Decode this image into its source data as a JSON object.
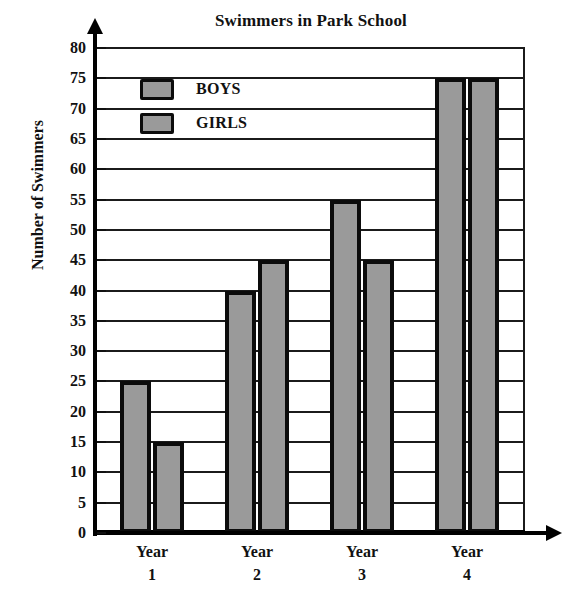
{
  "chart_data": {
    "type": "bar",
    "title": "Swimmers in Park School",
    "xlabel": "",
    "ylabel": "Number of Swimmers",
    "categories": [
      "Year 1",
      "Year 2",
      "Year 3",
      "Year 4"
    ],
    "category_lines": [
      {
        "line1": "Year",
        "line2": "1"
      },
      {
        "line1": "Year",
        "line2": "2"
      },
      {
        "line1": "Year",
        "line2": "3"
      },
      {
        "line1": "Year",
        "line2": "4"
      }
    ],
    "series": [
      {
        "name": "BOYS",
        "values": [
          25,
          40,
          55,
          75
        ],
        "color": "#9a9a9a"
      },
      {
        "name": "GIRLS",
        "values": [
          15,
          45,
          45,
          75
        ],
        "color": "#9a9a9a"
      }
    ],
    "ylim": [
      0,
      80
    ],
    "y_tick_step": 5,
    "y_ticks": [
      80,
      75,
      70,
      65,
      60,
      55,
      50,
      45,
      40,
      35,
      30,
      25,
      20,
      15,
      10,
      5,
      0
    ],
    "grid": true,
    "legend_position": "inside-top-left",
    "bar_border_color": "#0c0c0c",
    "axis_color": "#000000"
  },
  "legend": {
    "items": [
      {
        "label": "BOYS",
        "swatch": "legend-swatch-boys"
      },
      {
        "label": "GIRLS",
        "swatch": "legend-swatch-girls"
      }
    ]
  }
}
